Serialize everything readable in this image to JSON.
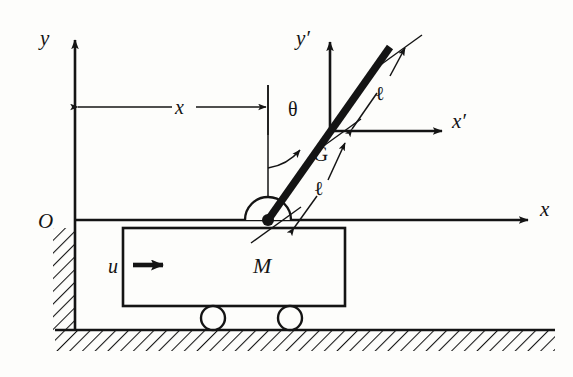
{
  "figure": {
    "background_color": "#fdfdfb",
    "ink_color": "#141414"
  },
  "labels": {
    "axis_y": "y",
    "axis_x": "x",
    "axis_y_prime": "y′",
    "axis_x_prime": "x′",
    "origin": "O",
    "displacement": "x",
    "angle": "θ",
    "centre_of_mass": "G",
    "half_length_upper": "ℓ",
    "half_length_lower": "ℓ",
    "cart_mass": "M",
    "input_force": "u"
  },
  "geometry": {
    "origin_point": [
      75,
      220
    ],
    "pivot_point": [
      268,
      220
    ],
    "centre_of_mass_point": [
      330,
      131
    ],
    "rod_tip_point": [
      390,
      47
    ],
    "ground_y": 330,
    "cart_rect": [
      123,
      228,
      222,
      78
    ],
    "wheel_radius": 12,
    "wheel_left_center": [
      213,
      318
    ],
    "wheel_right_center": [
      290,
      318
    ],
    "rod_thickness": 7,
    "pendulum_tilt_degrees": 35
  }
}
